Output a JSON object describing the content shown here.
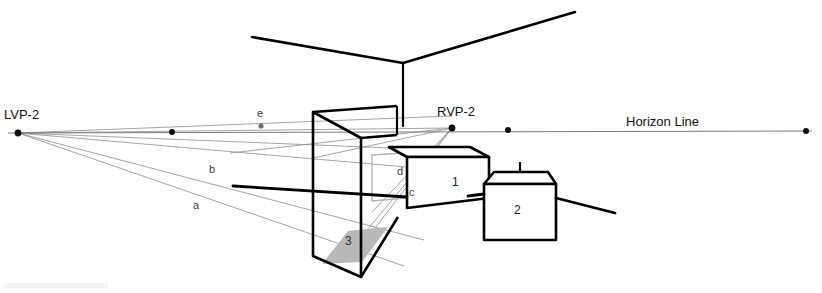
{
  "diagram": {
    "type": "perspective-construction-drawing",
    "canvas": {
      "width": 822,
      "height": 293,
      "background": "#ffffff"
    },
    "colors": {
      "object_line": "#000000",
      "construction_line": "#8d8d8d",
      "horizon_line": "#7a7a7a",
      "floor_shade": "#b8b8b8",
      "panel_line": "#b0b0b0",
      "text": "#111111"
    }
  },
  "labels": {
    "left_vanishing_point": "LVP-2",
    "right_vanishing_point": "RVP-2",
    "horizon_line": "Horizon Line",
    "ray_a": "a",
    "ray_b": "b",
    "ray_c": "c",
    "ray_d": "d",
    "ray_e": "e",
    "box_one": "1",
    "box_two": "2",
    "box_three": "3"
  },
  "geometry": {
    "horizon_y": 131,
    "left_vanishing_point": {
      "x": 18,
      "y": 133
    },
    "right_vanishing_point": {
      "x": 452,
      "y": 128
    },
    "horizon_dots": [
      {
        "x": 18,
        "y": 133
      },
      {
        "x": 172,
        "y": 132
      },
      {
        "x": 452,
        "y": 128
      },
      {
        "x": 508,
        "y": 130
      },
      {
        "x": 806,
        "y": 131
      }
    ],
    "horizon_span": {
      "x1": 8,
      "x2": 812
    },
    "ceiling": {
      "apex": {
        "x": 403,
        "y": 63
      },
      "left_end": {
        "x": 252,
        "y": 37
      },
      "right_end": {
        "x": 575,
        "y": 12
      },
      "corner_bottom": {
        "x": 403,
        "y": 126
      }
    },
    "tall_box": {
      "name": "box-3",
      "front_top_left": {
        "x": 313,
        "y": 112
      },
      "front_top_right": {
        "x": 361,
        "y": 138
      },
      "front_bottom_left": {
        "x": 313,
        "y": 256
      },
      "front_bottom_right": {
        "x": 361,
        "y": 277
      },
      "back_top_left": {
        "x": 313,
        "y": 106
      },
      "floor_shade_points": "321,264 346,232 386,228 361,262"
    },
    "box_one": {
      "name": "box-1",
      "front_top_left": {
        "x": 407,
        "y": 157
      },
      "front_top_right": {
        "x": 489,
        "y": 157
      },
      "front_bottom_left": {
        "x": 407,
        "y": 208
      },
      "front_bottom_right": {
        "x": 489,
        "y": 198
      },
      "top_back_left": {
        "x": 389,
        "y": 147
      },
      "top_back_right": {
        "x": 470,
        "y": 147
      }
    },
    "box_two": {
      "name": "box-2",
      "front_top_left": {
        "x": 484,
        "y": 184
      },
      "front_top_right": {
        "x": 556,
        "y": 184
      },
      "front_bottom_left": {
        "x": 484,
        "y": 240
      },
      "front_bottom_right": {
        "x": 556,
        "y": 240
      },
      "top_back_left": {
        "x": 494,
        "y": 172
      },
      "top_back_right": {
        "x": 548,
        "y": 172
      }
    },
    "thick_rays": [
      {
        "name": "left-thick-ray",
        "x1": 233,
        "y1": 186,
        "x2": 407,
        "y2": 196
      },
      {
        "name": "right-thick-ray",
        "x1": 556,
        "y1": 198,
        "x2": 615,
        "y2": 212
      }
    ],
    "construction_rays_from_lvp": [
      {
        "name": "ray-e",
        "x2": 452,
        "y2": 128,
        "label_x": 261,
        "label_y": 112
      },
      {
        "name": "ray-top",
        "x2": 452,
        "y2": 115
      },
      {
        "name": "ray-b",
        "x2": 452,
        "y2": 170,
        "label_x": 211,
        "label_y": 170
      },
      {
        "name": "ray-a",
        "x2": 420,
        "y2": 236,
        "label_x": 195,
        "label_y": 205
      },
      {
        "name": "ray-floor",
        "x2": 400,
        "y2": 262
      }
    ],
    "construction_rays_from_rvp": [
      {
        "name": "ray-c",
        "x2": 366,
        "y2": 231,
        "label_x": 411,
        "label_y": 193
      },
      {
        "name": "ray-d",
        "x2": 375,
        "y2": 205,
        "label_x": 400,
        "label_y": 172
      },
      {
        "name": "ray-rvp-low",
        "x2": 356,
        "y2": 255
      }
    ],
    "inner_panel": {
      "top_left": {
        "x": 372,
        "y": 155
      },
      "top_right": {
        "x": 418,
        "y": 155
      },
      "bottom_left": {
        "x": 372,
        "y": 200
      },
      "bottom_right": {
        "x": 418,
        "y": 196
      }
    }
  }
}
